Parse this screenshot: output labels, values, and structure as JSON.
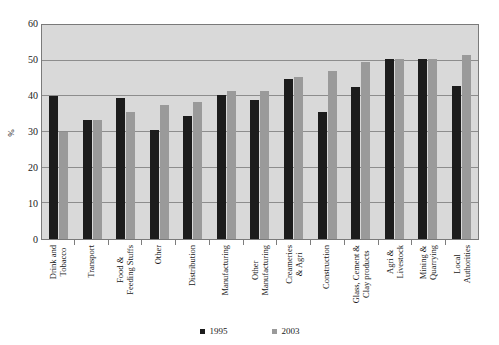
{
  "top_sliver_text": "",
  "legend": {
    "position": "bottom-center",
    "entries": [
      {
        "label": "1995",
        "color": "#1c1c1c",
        "icon": "square-marker-icon"
      },
      {
        "label": "2003",
        "color": "#9a9a9a",
        "icon": "square-marker-icon"
      }
    ]
  },
  "axis": {
    "y_title": "%",
    "y_ticks": [
      "0",
      "10",
      "20",
      "30",
      "40",
      "50",
      "60"
    ]
  },
  "chart_data": {
    "type": "bar",
    "title": "",
    "subtitle": "",
    "xlabel": "",
    "ylabel": "%",
    "ylim": [
      0,
      60
    ],
    "ytick_step": 10,
    "grid": true,
    "grid_axis": "y",
    "legend_position": "bottom-center",
    "plot_background": "#d9d9d9",
    "categories": [
      "Drink and Tobacco",
      "Transport",
      "Food & Feeding Stuffs",
      "Other",
      "Distribution",
      "Manufacturing",
      "Other Manufacturing",
      "Creameries & Agri",
      "Construction",
      "Glass, Cement & Clay products",
      "Agri & Livestock",
      "Mining & Quarrying",
      "Local Authorities"
    ],
    "category_lines": [
      [
        "Drink and",
        "Tobacco"
      ],
      [
        "Transport",
        ""
      ],
      [
        "Food &",
        "Feeding Stuffs"
      ],
      [
        "Other",
        ""
      ],
      [
        "Distribution",
        ""
      ],
      [
        "Manufacturing",
        ""
      ],
      [
        "Other",
        "Manufacturing"
      ],
      [
        "Creameries",
        "& Agri"
      ],
      [
        "Construction",
        ""
      ],
      [
        "Glass, Cement &",
        "Clay products"
      ],
      [
        "Agri &",
        "Livestock"
      ],
      [
        "Mining &",
        "Quarrying"
      ],
      [
        "Local",
        "Authorities"
      ]
    ],
    "series": [
      {
        "name": "1995",
        "color": "#1c1c1c",
        "values": [
          40,
          33.5,
          39.5,
          30.5,
          34.5,
          40.5,
          39,
          45,
          35.5,
          42.5,
          50.5,
          50.5,
          43
        ]
      },
      {
        "name": "2003",
        "color": "#9a9a9a",
        "values": [
          30,
          33.5,
          35.5,
          37.5,
          38.5,
          41.5,
          41.5,
          45.5,
          47,
          49.5,
          50.5,
          50.5,
          51.5
        ]
      }
    ]
  }
}
